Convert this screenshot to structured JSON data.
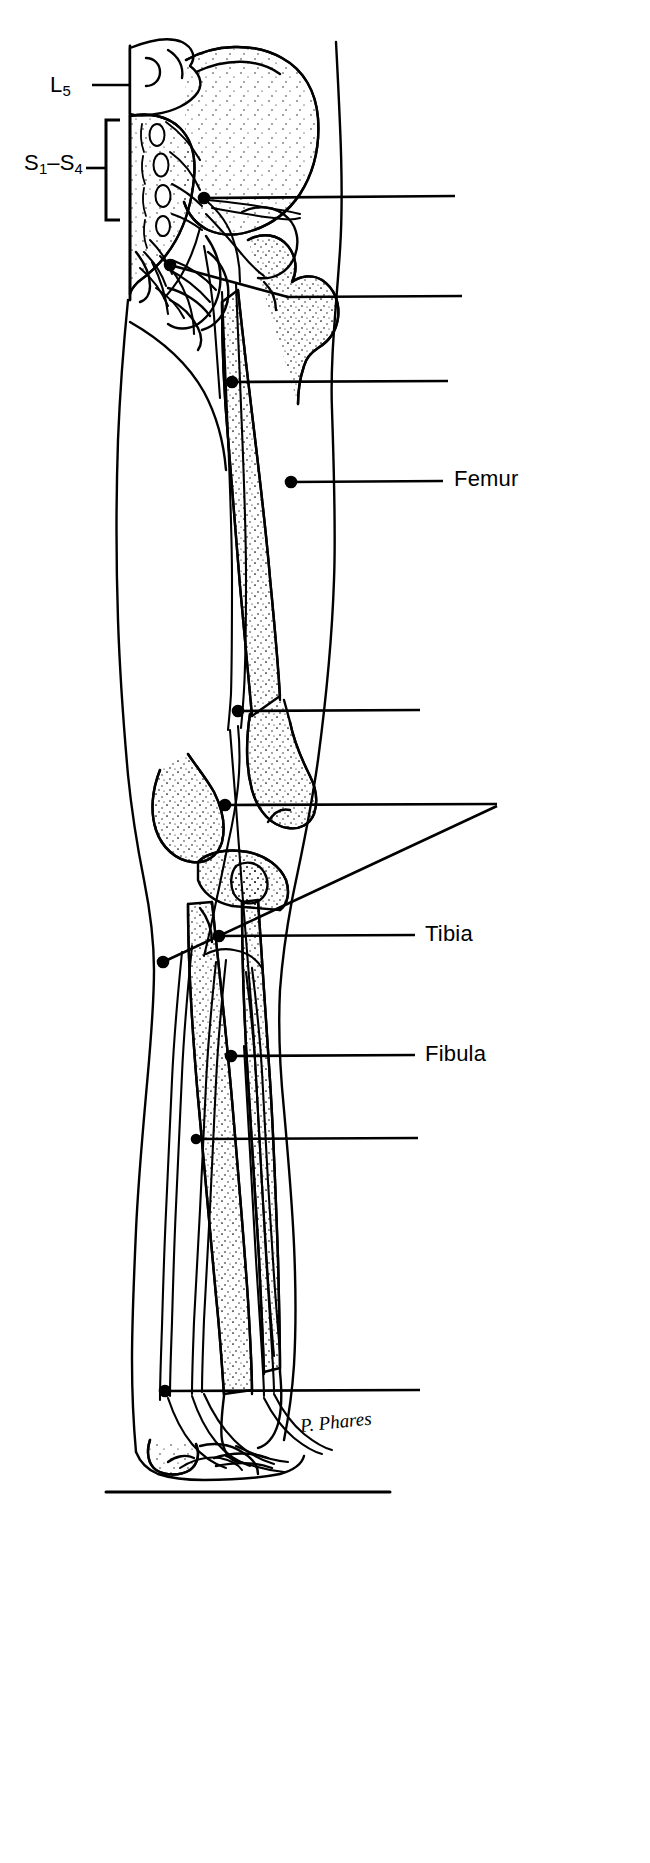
{
  "figure": {
    "view": "posterior view of right lower limb with spinal nerve roots, bones and peripheral nerves",
    "background_color": "#ffffff",
    "ink_color": "#000000",
    "width": 650,
    "height": 1863
  },
  "labels": {
    "spinal_root_l5": "L",
    "spinal_root_l5_sub": "5",
    "sacral_roots_prefix": "S",
    "sacral_roots_first_sub": "1",
    "sacral_roots_dash": "–",
    "sacral_roots_second": "S",
    "sacral_roots_second_sub": "4",
    "femur": "Femur",
    "tibia": "Tibia",
    "fibula": "Fibula"
  },
  "bracket": {
    "name": "sacral-root-bracket",
    "spans_label": "S1-S4",
    "x": 108,
    "y_top": 120,
    "y_bottom": 220
  },
  "leader_lines": [
    {
      "id": "leader-l5",
      "label": "L5",
      "labeled": true,
      "y": 85,
      "x_start": 92,
      "x_end": 130,
      "dot": false
    },
    {
      "id": "leader-s1s4",
      "label": "S1–S4",
      "labeled": true,
      "y": 165,
      "x_start": 92,
      "x_end": 108,
      "dot": false
    },
    {
      "id": "leader-1",
      "label": "",
      "labeled": false,
      "y": 198,
      "x_start": 204,
      "x_end": 455,
      "dot": true
    },
    {
      "id": "leader-2",
      "label": "",
      "labeled": false,
      "y": 296,
      "x_start": 170,
      "x_end": 462,
      "dot": true
    },
    {
      "id": "leader-3",
      "label": "",
      "labeled": false,
      "y": 382,
      "x_start": 232,
      "x_end": 448,
      "dot": true
    },
    {
      "id": "leader-femur",
      "label": "Femur",
      "labeled": true,
      "y": 481,
      "x_start": 291,
      "x_end": 443,
      "dot": true
    },
    {
      "id": "leader-4",
      "label": "",
      "labeled": false,
      "y": 711,
      "x_start": 238,
      "x_end": 420,
      "dot": true
    },
    {
      "id": "leader-5",
      "label": "",
      "labeled": false,
      "y": 805,
      "x_start": 225,
      "x_end": 495,
      "dot": true
    },
    {
      "id": "leader-6-angled",
      "label": "",
      "labeled": false,
      "y": 960,
      "x_start": 163,
      "x_end": 495,
      "dot": true,
      "angled": true
    },
    {
      "id": "leader-tibia",
      "label": "Tibia",
      "labeled": true,
      "y": 935,
      "x_start": 219,
      "x_end": 415,
      "dot": true
    },
    {
      "id": "leader-fibula",
      "label": "Fibula",
      "labeled": true,
      "y": 1055,
      "x_start": 231,
      "x_end": 415,
      "dot": true
    },
    {
      "id": "leader-7",
      "label": "",
      "labeled": false,
      "y": 1138,
      "x_start": 196,
      "x_end": 418,
      "dot": true
    },
    {
      "id": "leader-8",
      "label": "",
      "labeled": false,
      "y": 1390,
      "x_start": 165,
      "x_end": 420,
      "dot": true
    }
  ],
  "signature": {
    "text": "P. Phares",
    "style": "handwritten italic"
  },
  "ground_line": {
    "name": "ground-baseline",
    "y": 1492,
    "x_start": 106,
    "x_end": 390
  }
}
